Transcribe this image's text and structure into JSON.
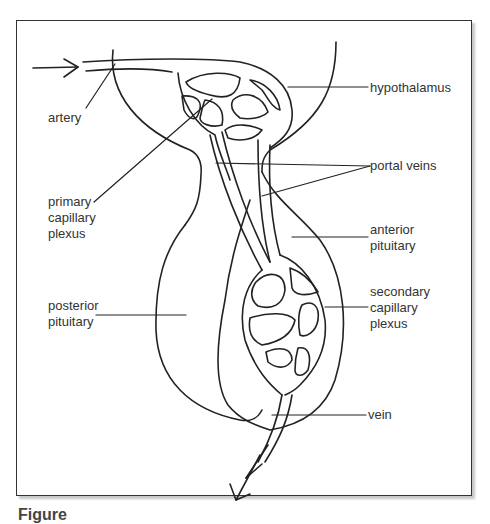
{
  "figure": {
    "caption": "Figure",
    "line_color": "#222222",
    "text_color": "#333333"
  },
  "labels": {
    "artery": "artery",
    "hypothalamus": "hypothalamus",
    "primary_capillary_plexus": "primary\ncapillary\nplexus",
    "portal_veins": "portal veins",
    "anterior_pituitary": "anterior\npituitary",
    "secondary_capillary_plexus": "secondary\ncapillary\nplexus",
    "posterior_pituitary": "posterior\npituitary",
    "vein": "vein"
  }
}
